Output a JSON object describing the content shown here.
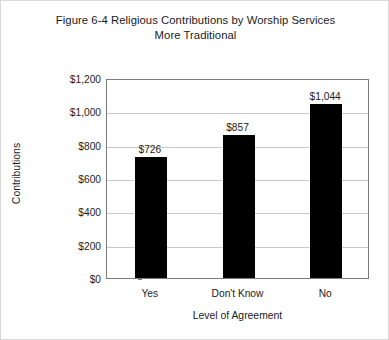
{
  "chart_data": {
    "type": "bar",
    "title": "Figure 6-4 Religious Contributions by Worship Services More Traditional",
    "title_lines": [
      "Figure 6-4 Religious Contributions by Worship Services",
      "More Traditional"
    ],
    "categories": [
      "Yes",
      "Don't Know",
      "No"
    ],
    "values": [
      726,
      857,
      1044
    ],
    "value_labels": [
      "$726",
      "$857",
      "$1,044"
    ],
    "xlabel": "Level of Agreement",
    "ylabel": "Contributions",
    "ylim": [
      0,
      1200
    ],
    "ytick_values": [
      0,
      200,
      400,
      600,
      800,
      1000,
      1200
    ],
    "ytick_labels": [
      "$0",
      "$200",
      "$400",
      "$600",
      "$800",
      "$1,000",
      "$1,200"
    ],
    "grid": true,
    "legend": false,
    "series": [
      {
        "name": "Contributions",
        "values": [
          726,
          857,
          1044
        ],
        "color": "#000000"
      }
    ],
    "colors": {
      "bar": "#000000",
      "gridline": "#c9c9c9",
      "axis": "#7b7b7b",
      "text": "#1b1b1b",
      "background": "#ffffff",
      "frame": "#d8d8d8"
    }
  }
}
